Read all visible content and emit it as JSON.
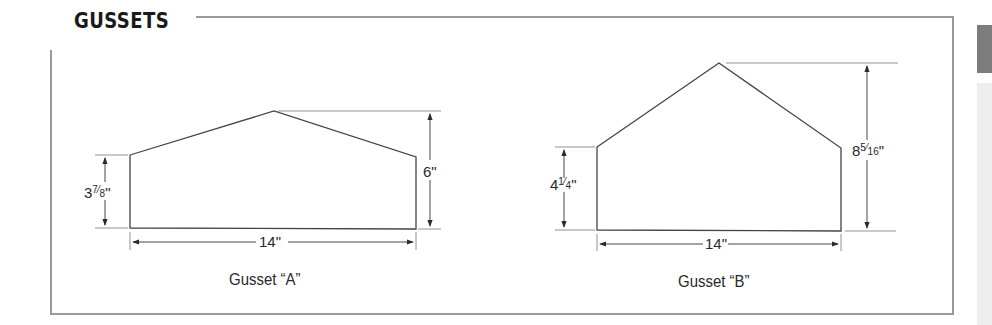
{
  "header": {
    "title": "GUSSETS"
  },
  "gussets": [
    {
      "name": "Gusset “A”",
      "width_label": "14\"",
      "side_height_label_whole": "3",
      "side_height_label_frac_num": "7",
      "side_height_label_frac_den": "8",
      "side_height_label_suffix": "\"",
      "peak_height_label": "6\""
    },
    {
      "name": "Gusset “B”",
      "width_label": "14\"",
      "side_height_label_whole": "4",
      "side_height_label_frac_num": "1",
      "side_height_label_frac_den": "4",
      "side_height_label_suffix": "\"",
      "peak_height_label_whole": "8",
      "peak_height_label_frac_num": "5",
      "peak_height_label_frac_den": "16",
      "peak_height_label_suffix": "\""
    }
  ],
  "colors": {
    "frame": "#9a9a9a",
    "line": "#3a3a3a",
    "tab_dark": "#7d7d7d",
    "tab_light": "#eeeeee"
  }
}
